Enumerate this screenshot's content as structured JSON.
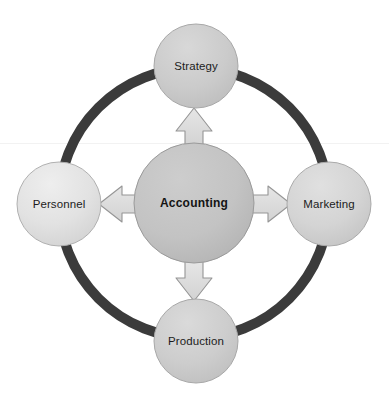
{
  "diagram": {
    "type": "cycle-hub-and-spoke",
    "background_color": "#ffffff",
    "ring": {
      "name": "outer-cycle-ring",
      "color": "#3b3b3b",
      "center_x": 194,
      "center_y": 203,
      "radius": 135,
      "stroke_width": 10
    },
    "center_node": {
      "label": "Accounting",
      "fill_color": "#c3c3c3",
      "stroke_color": "#9a9a9a",
      "text_color": "#141414",
      "bold": true,
      "cx": 194,
      "cy": 203,
      "r": 60
    },
    "nodes": [
      {
        "id": "strategy",
        "label": "Strategy",
        "position": "top",
        "fill_color": "#cdcdcd",
        "stroke_color": "#a8a8a8",
        "text_color": "#1c1c1c",
        "cx": 196,
        "cy": 66,
        "r": 42
      },
      {
        "id": "marketing",
        "label": "Marketing",
        "position": "right",
        "fill_color": "#d6d6d6",
        "stroke_color": "#aaaaaa",
        "text_color": "#1c1c1c",
        "cx": 329,
        "cy": 204,
        "r": 42
      },
      {
        "id": "production",
        "label": "Production",
        "position": "bottom",
        "fill_color": "#cfcfcf",
        "stroke_color": "#a8a8a8",
        "text_color": "#1c1c1c",
        "cx": 196,
        "cy": 341,
        "r": 42
      },
      {
        "id": "personnel",
        "label": "Personnel",
        "position": "left",
        "fill_color": "#e2e2e2",
        "stroke_color": "#b0b0b0",
        "text_color": "#1c1c1c",
        "cx": 59,
        "cy": 204,
        "r": 42
      }
    ],
    "arrows": [
      {
        "id": "arrow-up",
        "direction": "up",
        "from": "Accounting",
        "to": "Strategy",
        "fill_color": "#dcdcdc",
        "stroke_color": "#959595"
      },
      {
        "id": "arrow-right",
        "direction": "right",
        "from": "Accounting",
        "to": "Marketing",
        "fill_color": "#dcdcdc",
        "stroke_color": "#959595"
      },
      {
        "id": "arrow-down",
        "direction": "down",
        "from": "Accounting",
        "to": "Production",
        "fill_color": "#dcdcdc",
        "stroke_color": "#959595"
      },
      {
        "id": "arrow-left",
        "direction": "left",
        "from": "Accounting",
        "to": "Personnel",
        "fill_color": "#dcdcdc",
        "stroke_color": "#959595"
      }
    ]
  }
}
